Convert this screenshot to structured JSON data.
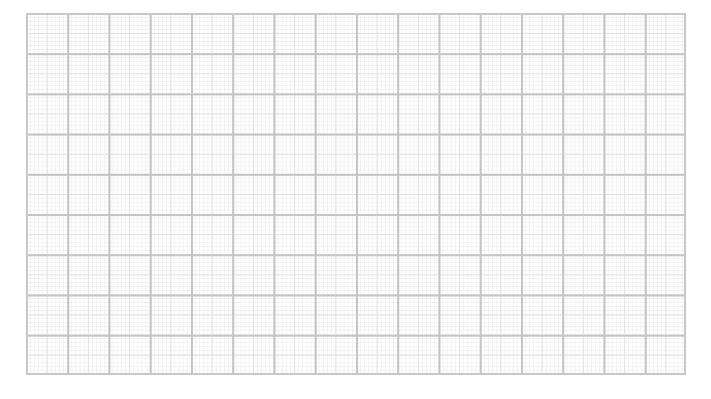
{
  "graph_paper": {
    "major_columns": 16,
    "major_rows": 9,
    "minor_divisions_per_major": 10,
    "colors": {
      "major_line": "#c4c4c4",
      "half_line": "#e2e2e2",
      "minor_line": "#f0f0f0",
      "background": "#ffffff"
    }
  }
}
